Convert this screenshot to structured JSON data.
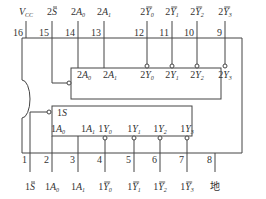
{
  "diagram": {
    "type": "ic-pinout",
    "stroke_color": "#444444",
    "top_pins": [
      {
        "num": "16",
        "label": "V",
        "sub": "CC",
        "bar": false,
        "prefix": ""
      },
      {
        "num": "15",
        "label": "S",
        "sub": "",
        "bar": true,
        "prefix": "2"
      },
      {
        "num": "14",
        "label": "A",
        "sub": "0",
        "bar": false,
        "prefix": "2"
      },
      {
        "num": "13",
        "label": "A",
        "sub": "1",
        "bar": false,
        "prefix": "2"
      },
      {
        "num": "12",
        "label": "Y",
        "sub": "0",
        "bar": true,
        "prefix": "2"
      },
      {
        "num": "11",
        "label": "Y",
        "sub": "1",
        "bar": true,
        "prefix": "2"
      },
      {
        "num": "10",
        "label": "Y",
        "sub": "2",
        "bar": true,
        "prefix": "2"
      },
      {
        "num": "9",
        "label": "Y",
        "sub": "3",
        "bar": true,
        "prefix": "2"
      }
    ],
    "bottom_pins": [
      {
        "num": "1",
        "label": "S",
        "sub": "",
        "bar": true,
        "prefix": "1"
      },
      {
        "num": "2",
        "label": "A",
        "sub": "0",
        "bar": false,
        "prefix": "1"
      },
      {
        "num": "3",
        "label": "A",
        "sub": "1",
        "bar": false,
        "prefix": "1"
      },
      {
        "num": "4",
        "label": "Y",
        "sub": "0",
        "bar": true,
        "prefix": "1"
      },
      {
        "num": "5",
        "label": "Y",
        "sub": "1",
        "bar": true,
        "prefix": "1"
      },
      {
        "num": "6",
        "label": "Y",
        "sub": "2",
        "bar": true,
        "prefix": "1"
      },
      {
        "num": "7",
        "label": "Y",
        "sub": "3",
        "bar": true,
        "prefix": "1"
      },
      {
        "num": "8",
        "label": "地",
        "sub": "",
        "bar": false,
        "prefix": ""
      }
    ],
    "upper_block": {
      "inputs": [
        {
          "prefix": "2",
          "label": "A",
          "sub": "0"
        },
        {
          "prefix": "2",
          "label": "A",
          "sub": "1"
        }
      ],
      "outputs": [
        {
          "prefix": "2",
          "label": "Y",
          "sub": "0"
        },
        {
          "prefix": "2",
          "label": "Y",
          "sub": "1"
        },
        {
          "prefix": "2",
          "label": "Y",
          "sub": "2"
        },
        {
          "prefix": "2",
          "label": "Y",
          "sub": "3"
        }
      ]
    },
    "lower_block": {
      "enable": {
        "prefix": "1",
        "label": "S"
      },
      "inputs": [
        {
          "prefix": "1",
          "label": "A",
          "sub": "0"
        },
        {
          "prefix": "1",
          "label": "A",
          "sub": "1"
        }
      ],
      "outputs": [
        {
          "prefix": "1",
          "label": "Y",
          "sub": "0"
        },
        {
          "prefix": "1",
          "label": "Y",
          "sub": "1"
        },
        {
          "prefix": "1",
          "label": "Y",
          "sub": "2"
        },
        {
          "prefix": "1",
          "label": "Y",
          "sub": "3"
        }
      ]
    }
  }
}
